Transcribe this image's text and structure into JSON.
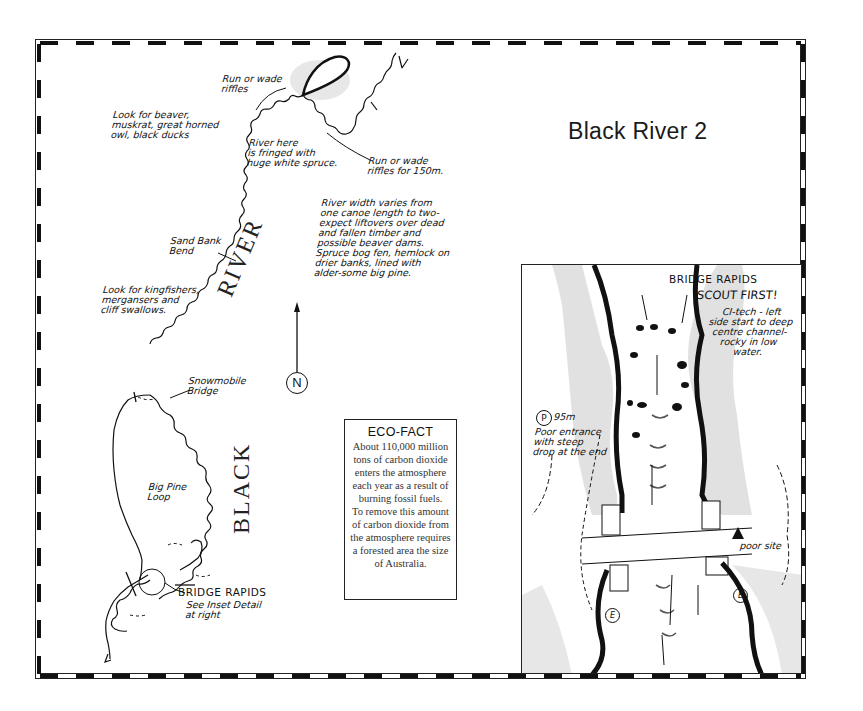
{
  "map": {
    "title": "Black River 2",
    "river_labels": {
      "upper": "RIVER",
      "lower": "BLACK"
    },
    "north_label": "N",
    "annotations": {
      "run_wade_riffles_upper": "Run or wade\nriffles",
      "run_wade_riffles_150": "Run or wade\nriffles for 150m.",
      "wildlife_beaver": "Look for beaver,\nmuskrat, great horned\nowl, black ducks",
      "river_fringed": "River here\nis fringed with\nhuge white spruce.",
      "river_width": "River width varies from\none canoe length to two-\nexpect liftovers over dead\nand fallen timber and\npossible beaver dams.\nSpruce bog fen, hemlock on\ndrier banks, lined with\nalder-some big pine.",
      "sand_bank_bend": "Sand Bank\nBend",
      "wildlife_kingfishers": "Look for kingfishers,\nmergansers and\ncliff swallows.",
      "snowmobile_bridge": "Snowmobile\nBridge",
      "big_pine_loop": "Big Pine\nLoop",
      "bridge_rapids": "BRIDGE RAPIDS",
      "bridge_rapids_sub": "See Inset Detail\nat right"
    }
  },
  "eco_fact": {
    "title": "ECO-FACT",
    "lines": [
      "About 110,000 million",
      "tons of carbon dioxide",
      "enters the atmosphere",
      "each year as a result of",
      "burning fossil fuels.",
      "To remove this amount",
      "of carbon dioxide from",
      "the atmosphere requires",
      "a forested area the size",
      "of Australia."
    ]
  },
  "inset": {
    "title": "BRIDGE RAPIDS",
    "warning": "SCOUT FIRST!",
    "rating_note": "CI-tech - left\nside start to deep\ncentre channel-\nrocky in low\nwater.",
    "portage_symbol": "P",
    "portage_length": "95m",
    "portage_note": "Poor entrance\nwith steep\ndrop at the end",
    "campsite_note": "poor site",
    "eddy_symbol": "E"
  }
}
